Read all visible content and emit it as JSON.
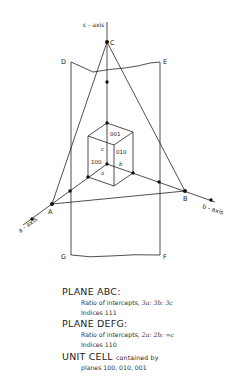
{
  "diagram": {
    "axes": {
      "c": "c - axis",
      "a": "a - axis",
      "b": "b - axis"
    },
    "points": {
      "A": "A",
      "B": "B",
      "C": "C",
      "D": "D",
      "E": "E",
      "F": "F",
      "G": "G"
    },
    "cube_labels": {
      "top": "001",
      "right": "010",
      "left": "100",
      "edge_a": "a",
      "edge_b": "b",
      "edge_c": "c"
    }
  },
  "legend": {
    "plane_abc": {
      "title": "PLANE ABC:",
      "line1_prefix": "Ratio of intercepts, ",
      "line1_ratio": "3a: 3b: 3c",
      "line2": "Indices 111"
    },
    "plane_defg": {
      "title": "PLANE DEFG:",
      "line1_prefix": "Ratio of intercepts, ",
      "line1_ratio": "2a: 2b: ∞c",
      "line2": "Indices 110"
    },
    "unit_cell": {
      "title": "UNIT CELL",
      "title_suffix": "contained by",
      "line2": "planes 100, 010, 001"
    }
  }
}
